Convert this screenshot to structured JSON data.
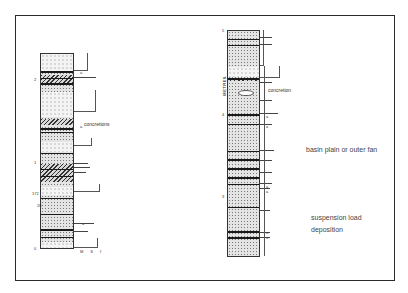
{
  "figure": {
    "frame": {
      "border_color": "#2a2a2a"
    },
    "left_log": {
      "scale_ticks": [
        "0",
        "1",
        "2"
      ],
      "side_labels": [
        "172",
        "20"
      ],
      "annotations": [
        "concretions"
      ],
      "bed_markers": [
        "a",
        "a",
        "a",
        "a"
      ],
      "grain_size_axis": [
        "M",
        "S",
        "f"
      ]
    },
    "right_log": {
      "axis_title": "METRES",
      "scale_ticks": [
        "3",
        "4",
        "5"
      ],
      "annotations": [
        "concretion"
      ],
      "bed_markers": [
        "a",
        "a",
        "a",
        "a",
        "a",
        "a"
      ]
    },
    "interpretation": {
      "environment": "basin plain  or outer fan",
      "process_line1": "suspension load",
      "process_line2": "deposition"
    }
  }
}
